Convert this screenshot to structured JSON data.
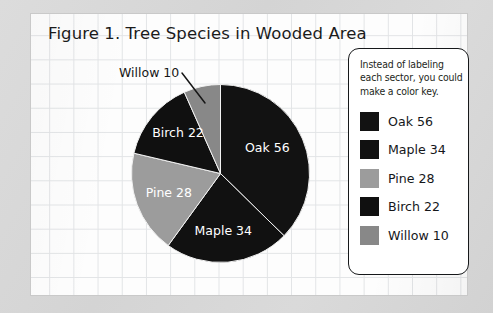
{
  "figure": {
    "title": "Figure 1. Tree Species in Wooded Area",
    "callout_label": "Willow 10"
  },
  "legend": {
    "note": "Instead of labeling each sector, you could make a color key.",
    "entries": [
      {
        "label": "Oak 56",
        "color": "#121212"
      },
      {
        "label": "Maple 34",
        "color": "#111111"
      },
      {
        "label": "Pine 28",
        "color": "#9c9c9c"
      },
      {
        "label": "Birch 22",
        "color": "#101010"
      },
      {
        "label": "Willow 10",
        "color": "#888888"
      }
    ]
  },
  "chart_data": {
    "type": "pie",
    "title": "Figure 1. Tree Species in Wooded Area",
    "categories": [
      "Oak",
      "Maple",
      "Pine",
      "Birch",
      "Willow"
    ],
    "values": [
      56,
      34,
      28,
      22,
      10
    ],
    "total": 150,
    "unit": "trees",
    "slice_labels": [
      "Oak 56",
      "Maple 34",
      "Pine 28",
      "Birch 22",
      "Willow 10"
    ],
    "colors": [
      "#121212",
      "#111111",
      "#9c9c9c",
      "#101010",
      "#888888"
    ],
    "start_angle_deg": 0,
    "direction": "clockwise",
    "legend_position": "right",
    "legend_title": "",
    "grid": true,
    "annotations": [
      {
        "text": "Willow 10",
        "target": "Willow",
        "style": "leader-line"
      },
      {
        "text": "Instead of labeling each sector, you could make a color key.",
        "target": "legend"
      }
    ]
  },
  "colors": {
    "sheet": "#fdfdfd",
    "grid_line": "#e2e4e6",
    "backdrop": "#d7d7d7",
    "ink": "#16181a",
    "slice_label_text": "#ffffff"
  }
}
